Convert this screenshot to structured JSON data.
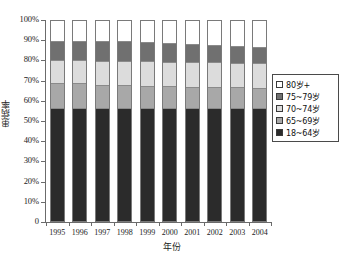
{
  "chart_data": {
    "type": "bar",
    "stacked": true,
    "stack_mode": "percent",
    "title": "",
    "xlabel": "年份",
    "ylabel": "患病率",
    "categories": [
      "1995",
      "1996",
      "1997",
      "1998",
      "1999",
      "2000",
      "2001",
      "2002",
      "2003",
      "2004"
    ],
    "ylim": [
      0,
      100
    ],
    "ytick_labels": [
      "0",
      "10%",
      "20%",
      "30%",
      "40%",
      "50%",
      "60%",
      "70%",
      "80%",
      "90%",
      "100%"
    ],
    "ytick_values": [
      0,
      10,
      20,
      30,
      40,
      50,
      60,
      70,
      80,
      90,
      100
    ],
    "grid": false,
    "legend_position": "right",
    "series": [
      {
        "name": "18~64岁",
        "color": "#2b2b2b",
        "values": [
          57.0,
          57.0,
          57.0,
          57.0,
          57.0,
          57.0,
          57.0,
          57.0,
          57.0,
          57.0
        ]
      },
      {
        "name": "65~69岁",
        "color": "#a8a8a8",
        "values": [
          12.5,
          12.5,
          11.5,
          11.5,
          11.0,
          11.0,
          10.5,
          10.5,
          10.5,
          10.0
        ]
      },
      {
        "name": "70~74岁",
        "color": "#dcdcdc",
        "values": [
          11.0,
          11.0,
          11.5,
          11.5,
          12.0,
          11.5,
          12.0,
          12.0,
          11.5,
          12.0
        ]
      },
      {
        "name": "75~79岁",
        "color": "#707070",
        "values": [
          9.5,
          9.5,
          10.0,
          10.0,
          9.5,
          9.5,
          9.0,
          8.5,
          8.5,
          8.0
        ]
      },
      {
        "name": "80岁+",
        "color": "#ffffff",
        "values": [
          10.0,
          10.0,
          10.0,
          10.0,
          10.5,
          11.0,
          11.5,
          12.0,
          12.5,
          13.0
        ]
      }
    ],
    "legend_entries": [
      {
        "label": "80岁+",
        "color": "#ffffff"
      },
      {
        "label": "75~79岁",
        "color": "#707070"
      },
      {
        "label": "70~74岁",
        "color": "#dcdcdc"
      },
      {
        "label": "65~69岁",
        "color": "#a8a8a8"
      },
      {
        "label": "18~64岁",
        "color": "#2b2b2b"
      }
    ]
  }
}
